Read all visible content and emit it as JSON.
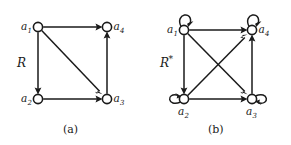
{
  "figure": {
    "background_color": "#ffffff",
    "ink_color": "#1a1a1a"
  },
  "panels": [
    {
      "id": "panel-a",
      "relation_label": "R",
      "relation_star": "",
      "caption": "(a)",
      "nodes": [
        {
          "id": "a1",
          "label": "a",
          "subscript": "1",
          "cx": 38,
          "cy": 27,
          "r": 4.6,
          "label_side": "left"
        },
        {
          "id": "a4",
          "label": "a",
          "subscript": "4",
          "cx": 107,
          "cy": 27,
          "r": 4.6,
          "label_side": "right"
        },
        {
          "id": "a2",
          "label": "a",
          "subscript": "2",
          "cx": 38,
          "cy": 99,
          "r": 4.6,
          "label_side": "left"
        },
        {
          "id": "a3",
          "label": "a",
          "subscript": "3",
          "cx": 107,
          "cy": 99,
          "r": 4.6,
          "label_side": "right"
        }
      ],
      "edges": [
        {
          "from": "a1",
          "to": "a4",
          "kind": "straight"
        },
        {
          "from": "a1",
          "to": "a2",
          "kind": "straight"
        },
        {
          "from": "a1",
          "to": "a3",
          "kind": "straight"
        },
        {
          "from": "a2",
          "to": "a3",
          "kind": "straight"
        },
        {
          "from": "a3",
          "to": "a4",
          "kind": "straight"
        }
      ],
      "self_loops": []
    },
    {
      "id": "panel-b",
      "relation_label": "R",
      "relation_star": "*",
      "caption": "(b)",
      "nodes": [
        {
          "id": "a1",
          "label": "a",
          "subscript": "1",
          "cx": 184,
          "cy": 30,
          "r": 4.6,
          "label_side": "left"
        },
        {
          "id": "a4",
          "label": "a",
          "subscript": "4",
          "cx": 252,
          "cy": 30,
          "r": 4.6,
          "label_side": "right"
        },
        {
          "id": "a2",
          "label": "a",
          "subscript": "2",
          "cx": 184,
          "cy": 99,
          "r": 4.6,
          "label_side": "below"
        },
        {
          "id": "a3",
          "label": "a",
          "subscript": "3",
          "cx": 252,
          "cy": 99,
          "r": 4.6,
          "label_side": "below"
        }
      ],
      "edges": [
        {
          "from": "a1",
          "to": "a4",
          "kind": "straight"
        },
        {
          "from": "a1",
          "to": "a2",
          "kind": "straight"
        },
        {
          "from": "a1",
          "to": "a3",
          "kind": "straight"
        },
        {
          "from": "a2",
          "to": "a3",
          "kind": "straight"
        },
        {
          "from": "a2",
          "to": "a4",
          "kind": "straight"
        },
        {
          "from": "a3",
          "to": "a4",
          "kind": "straight"
        }
      ],
      "self_loops": [
        {
          "node": "a1",
          "direction": "up"
        },
        {
          "node": "a4",
          "direction": "up"
        },
        {
          "node": "a2",
          "direction": "left"
        },
        {
          "node": "a3",
          "direction": "right"
        }
      ]
    }
  ]
}
